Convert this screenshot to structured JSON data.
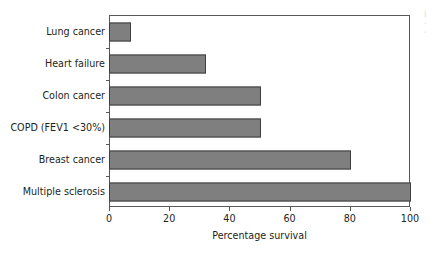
{
  "chart_data": {
    "type": "bar",
    "orientation": "horizontal",
    "title": "",
    "xlabel": "Percentage survival",
    "ylabel": "",
    "xlim": [
      0,
      100
    ],
    "xticks": [
      0,
      20,
      40,
      60,
      80,
      100
    ],
    "xtick_labels": [
      "0",
      "20",
      "40",
      "60",
      "80",
      "100"
    ],
    "grid": false,
    "legend": null,
    "bar_color": "#7f7f7f",
    "bar_edge_color": "#3f3f3f",
    "axis_color": "#58595b",
    "categories": [
      "Lung cancer",
      "Heart failure",
      "Colon cancer",
      "COPD (FEV1 <30%)",
      "Breast cancer",
      "Multiple sclerosis"
    ],
    "values": [
      7,
      32,
      50,
      50,
      80,
      100
    ]
  }
}
